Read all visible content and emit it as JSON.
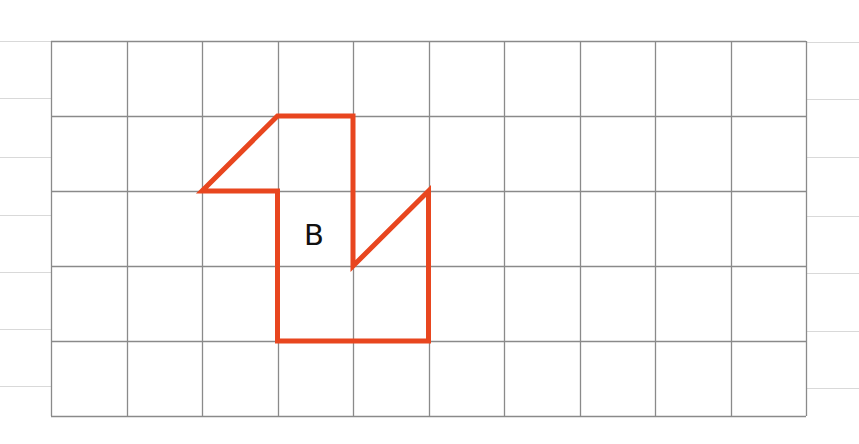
{
  "figure": {
    "type": "grid-shape",
    "grid": {
      "columns": 10,
      "rows": 5,
      "origin_px": [
        51,
        41
      ],
      "cell_w_px": 75.5,
      "cell_h_px": 75,
      "line_color": "#8a8a8a"
    },
    "margin_lines": {
      "color": "#d9d9d9",
      "left_y_px": [
        41,
        98,
        157,
        215,
        272,
        329,
        386
      ],
      "right_y_px": [
        42,
        99,
        157,
        216,
        273,
        331,
        388
      ]
    },
    "shape": {
      "label": "B",
      "stroke_color": "#e8461f",
      "stroke_width": 5,
      "vertices_grid": [
        [
          3,
          1
        ],
        [
          4,
          1
        ],
        [
          4,
          3
        ],
        [
          5,
          2
        ],
        [
          5,
          4
        ],
        [
          3,
          4
        ],
        [
          3,
          2
        ],
        [
          2,
          2
        ]
      ],
      "label_position_px": [
        314,
        245
      ]
    }
  }
}
